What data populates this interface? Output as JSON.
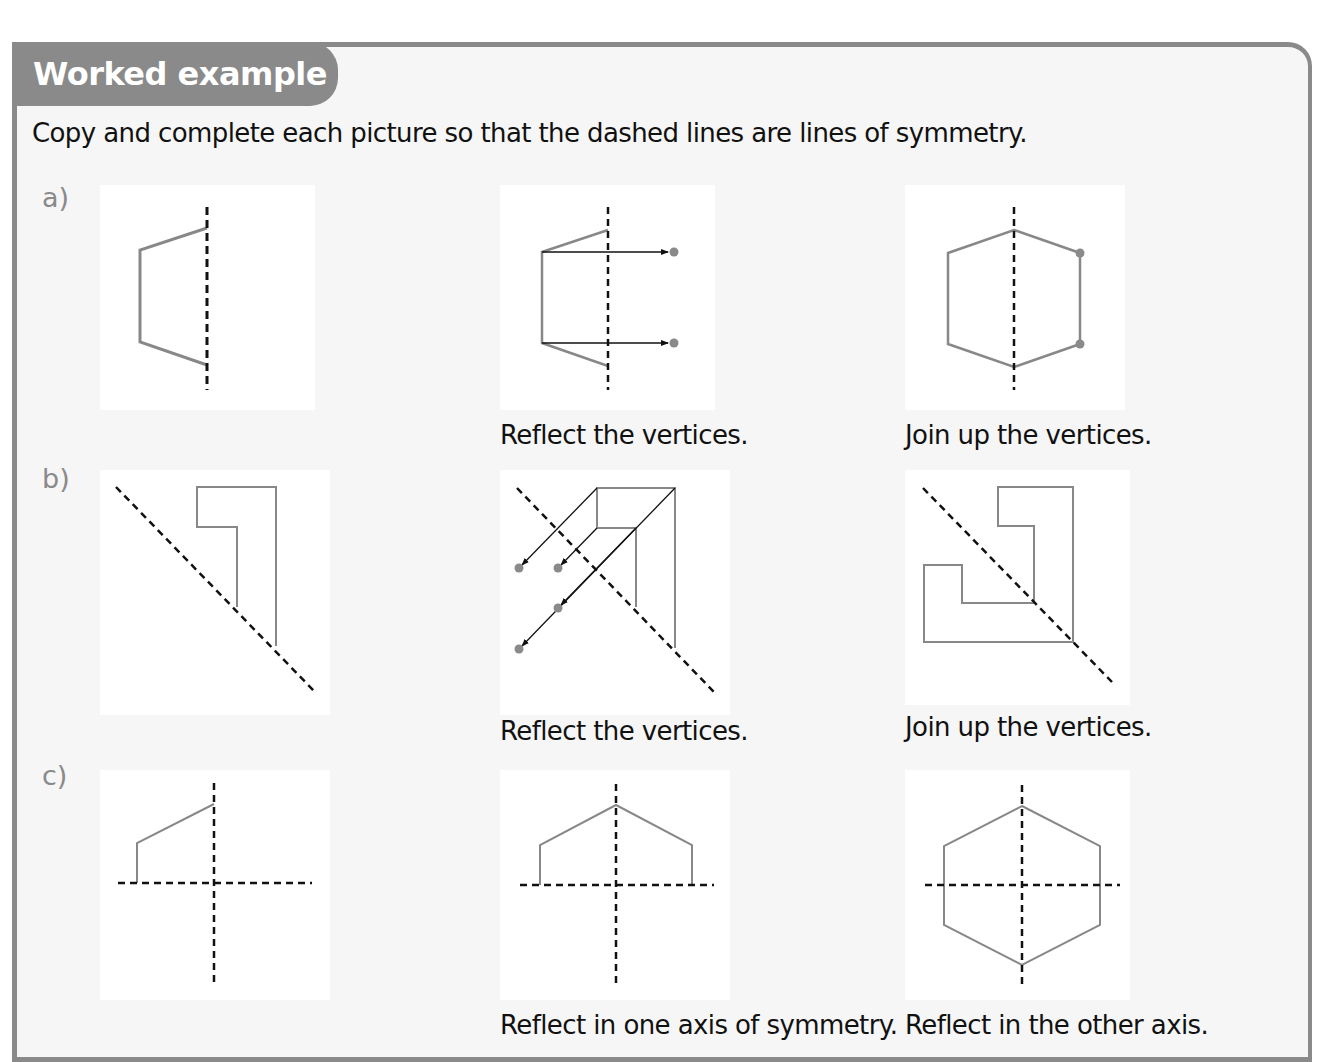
{
  "header": {
    "title": "Worked example"
  },
  "instruction": "Copy and complete each picture so that the dashed lines are lines of symmetry.",
  "parts": [
    {
      "label": "a)",
      "steps": [
        {
          "caption": ""
        },
        {
          "caption": "Reflect the vertices."
        },
        {
          "caption": "Join up the vertices."
        }
      ]
    },
    {
      "label": "b)",
      "steps": [
        {
          "caption": ""
        },
        {
          "caption": "Reflect the vertices."
        },
        {
          "caption": "Join up the vertices."
        }
      ]
    },
    {
      "label": "c)",
      "steps": [
        {
          "caption": ""
        },
        {
          "caption": "Reflect in one axis of symmetry."
        },
        {
          "caption": "Reflect in the other axis."
        }
      ]
    }
  ],
  "colors": {
    "frame": "#8a8a8a",
    "shape_stroke": "#888888",
    "symmetry_line": "#111111",
    "vertex_dot": "#8a8a8a"
  }
}
